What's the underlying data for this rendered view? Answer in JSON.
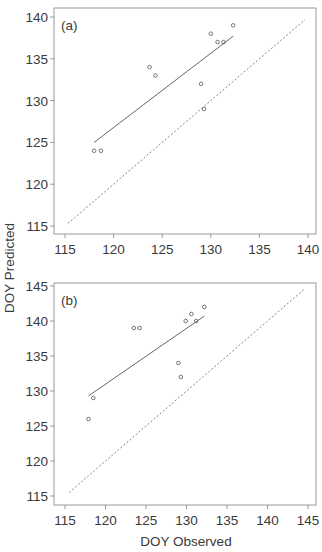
{
  "figure": {
    "ylabel": "DOY Predicted",
    "xlabel": "DOY Observed",
    "colors": {
      "frame": "#9a9a9a",
      "points": "#666666",
      "fit_line": "#555555",
      "one_to_one": "#777777",
      "text": "#3a3a3a"
    }
  },
  "chart_data": [
    {
      "type": "scatter",
      "panel_label": "(a)",
      "title": "",
      "xlabel": "",
      "ylabel": "DOY Predicted",
      "xlim": [
        114,
        141
      ],
      "ylim": [
        114,
        141
      ],
      "xticks": [
        115,
        120,
        125,
        130,
        135,
        140
      ],
      "yticks": [
        115,
        120,
        125,
        130,
        135,
        140
      ],
      "grid": false,
      "series": [
        {
          "name": "observations",
          "kind": "points",
          "x": [
            118,
            118.7,
            123.7,
            124.3,
            129,
            129.3,
            130,
            130.7,
            131.3,
            132.3
          ],
          "y": [
            124,
            124,
            134,
            133,
            132,
            129,
            138,
            137,
            137,
            139
          ]
        },
        {
          "name": "regression fit",
          "kind": "solid-line",
          "x": [
            118,
            132.3
          ],
          "y": [
            125,
            137.7
          ]
        },
        {
          "name": "1:1 line",
          "kind": "dashed-line",
          "x": [
            115.3,
            139.7
          ],
          "y": [
            115.3,
            139.7
          ]
        }
      ]
    },
    {
      "type": "scatter",
      "panel_label": "(b)",
      "title": "",
      "xlabel": "DOY Observed",
      "ylabel": "DOY Predicted",
      "xlim": [
        114,
        146
      ],
      "ylim": [
        114,
        146
      ],
      "xticks": [
        115,
        120,
        125,
        130,
        135,
        140,
        145
      ],
      "yticks": [
        115,
        120,
        125,
        130,
        135,
        140,
        145
      ],
      "grid": false,
      "series": [
        {
          "name": "observations",
          "kind": "points",
          "x": [
            117.9,
            118.5,
            123.5,
            124.2,
            129,
            129.3,
            129.9,
            130.6,
            131.2,
            132.2
          ],
          "y": [
            126,
            129,
            139,
            139,
            134,
            132,
            140,
            141,
            140,
            142
          ]
        },
        {
          "name": "regression fit",
          "kind": "solid-line",
          "x": [
            117.9,
            132.2
          ],
          "y": [
            129.3,
            140.7
          ]
        },
        {
          "name": "1:1 line",
          "kind": "dashed-line",
          "x": [
            115.5,
            144.5
          ],
          "y": [
            115.5,
            144.5
          ]
        }
      ]
    }
  ]
}
